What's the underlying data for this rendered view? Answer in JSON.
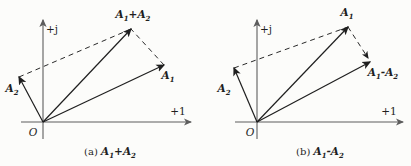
{
  "figure": {
    "width": 411,
    "height": 166,
    "background": "#fcfcfa",
    "ink_color": "#1f1f1f",
    "axis_color": "#5d5d5d",
    "dash_color": "#2a2a2a",
    "diagrams": [
      {
        "id": "a",
        "caption_prefix": "(a)",
        "caption_formula": "A_1+A_2",
        "caption_pos": [
          110,
          155
        ],
        "origin": [
          43,
          122
        ],
        "origin_label": "O",
        "origin_label_pos": [
          33,
          136
        ],
        "axes": {
          "x": {
            "from": [
              21,
              122
            ],
            "to": [
              191,
              122
            ],
            "label": "+1",
            "label_pos": [
              178,
              115
            ]
          },
          "y": {
            "from": [
              43,
              139
            ],
            "to": [
              43,
              20
            ],
            "label": "+j",
            "label_pos": [
              52,
              33
            ]
          }
        },
        "vectors": [
          {
            "name": "A2",
            "to": [
              19,
              77
            ],
            "label": "A_2",
            "label_pos": [
              12,
              92
            ]
          },
          {
            "name": "A1",
            "to": [
              164,
              65
            ],
            "label": "A_1",
            "label_pos": [
              168,
              79
            ]
          },
          {
            "name": "A1plusA2",
            "to": [
              131,
              29
            ],
            "label": "A_1+A_2",
            "label_pos": [
              133,
              18
            ]
          }
        ],
        "dashed": [
          {
            "from": [
              19,
              77
            ],
            "to": [
              131,
              29
            ],
            "arrow": false
          },
          {
            "from": [
              164,
              65
            ],
            "to": [
              131,
              29
            ],
            "arrow": false
          }
        ]
      },
      {
        "id": "b",
        "caption_prefix": "(b)",
        "caption_formula": "A_1-A_2",
        "caption_pos": [
          320,
          155
        ],
        "origin": [
          257,
          122
        ],
        "origin_label": "O",
        "origin_label_pos": [
          250,
          136
        ],
        "axes": {
          "x": {
            "from": [
              235,
              122
            ],
            "to": [
              403,
              122
            ],
            "label": "+1",
            "label_pos": [
              389,
              115
            ]
          },
          "y": {
            "from": [
              257,
              139
            ],
            "to": [
              257,
              20
            ],
            "label": "+j",
            "label_pos": [
              266,
              33
            ]
          }
        },
        "vectors": [
          {
            "name": "A2",
            "to": [
              234,
              68
            ],
            "label": "A_2",
            "label_pos": [
              224,
              92
            ]
          },
          {
            "name": "A1",
            "to": [
              348,
              27
            ],
            "label": "A_1",
            "label_pos": [
              347,
              16
            ]
          },
          {
            "name": "A1minusA2",
            "to": [
              370,
              62
            ],
            "label": "A_1-A_2",
            "label_pos": [
              383,
              76
            ]
          }
        ],
        "dashed": [
          {
            "from": [
              234,
              68
            ],
            "to": [
              348,
              27
            ],
            "arrow": false
          },
          {
            "from": [
              348,
              27
            ],
            "to": [
              368,
              58
            ],
            "arrow": true
          }
        ]
      }
    ]
  }
}
